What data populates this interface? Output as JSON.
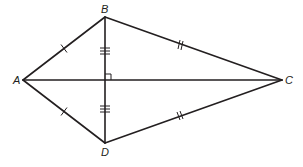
{
  "diagram": {
    "type": "kite",
    "stroke_color": "#231f20",
    "background": "#ffffff",
    "vertices": [
      {
        "label": "A",
        "x": 23,
        "y": 80
      },
      {
        "label": "B",
        "x": 105,
        "y": 17
      },
      {
        "label": "C",
        "x": 282,
        "y": 80
      },
      {
        "label": "D",
        "x": 105,
        "y": 143
      }
    ],
    "segments": [
      {
        "from": "A",
        "to": "B",
        "ticks": 1
      },
      {
        "from": "A",
        "to": "D",
        "ticks": 1
      },
      {
        "from": "B",
        "to": "C",
        "ticks": 2
      },
      {
        "from": "D",
        "to": "C",
        "ticks": 2
      },
      {
        "from": "A",
        "to": "C",
        "ticks": 0
      },
      {
        "from": "B",
        "to": "D",
        "ticks": 0
      }
    ],
    "diagonal_halves": [
      {
        "from": "B",
        "to": "intersection",
        "ticks": 3
      },
      {
        "from": "intersection",
        "to": "D",
        "ticks": 3
      }
    ],
    "right_angle_marker": {
      "at": "intersection",
      "x": 105,
      "y": 80
    },
    "labels": {
      "A": "A",
      "B": "B",
      "C": "C",
      "D": "D"
    }
  }
}
